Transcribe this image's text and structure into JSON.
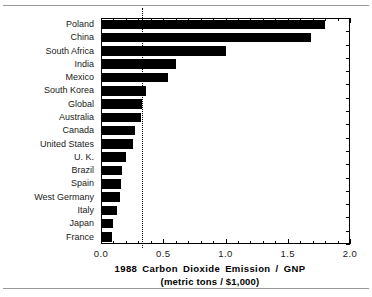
{
  "chart_data": {
    "type": "bar",
    "orientation": "horizontal",
    "title": "",
    "xlabel": "1988 Carbon Dioxide Emission / GNP",
    "xlabel_sub": "(metric tons / $1,000)",
    "ylabel": "",
    "xlim": [
      0.0,
      2.0
    ],
    "xticks": [
      "0.0",
      "0.5",
      "1.0",
      "1.5",
      "2.0"
    ],
    "xtick_values": [
      0.0,
      0.5,
      1.0,
      1.5,
      2.0
    ],
    "minor_tick_step": 0.1,
    "grid": false,
    "legend": "none",
    "units": "metric tons / $1,000",
    "bar_color": "#000000",
    "categories": [
      "Poland",
      "China",
      "South Africa",
      "India",
      "Mexico",
      "South Korea",
      "Global",
      "Australia",
      "Canada",
      "United States",
      "U. K.",
      "Brazil",
      "Spain",
      "West Germany",
      "Italy",
      "Japan",
      "France"
    ],
    "values": [
      1.8,
      1.69,
      1.0,
      0.6,
      0.54,
      0.36,
      0.33,
      0.32,
      0.27,
      0.26,
      0.2,
      0.17,
      0.16,
      0.155,
      0.13,
      0.1,
      0.09
    ],
    "annotations": [
      {
        "name": "global-reference-line",
        "type": "vertical-dotted-line",
        "value": 0.33,
        "label": ""
      }
    ]
  }
}
